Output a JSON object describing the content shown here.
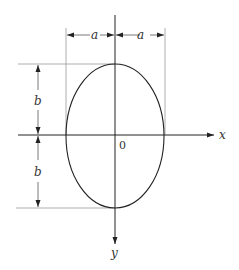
{
  "diagram": {
    "labels": {
      "a_left": "a",
      "a_right": "a",
      "b_top": "b",
      "b_bottom": "b",
      "origin": "0",
      "x_axis": "x",
      "y_axis": "y"
    },
    "colors": {
      "stroke": "#222222",
      "dimension": "#888888",
      "background": "#ffffff"
    }
  }
}
